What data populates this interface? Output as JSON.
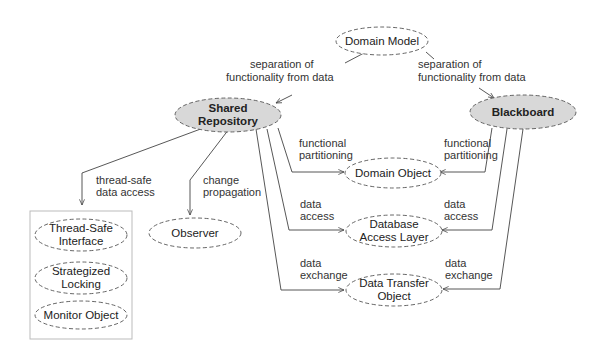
{
  "diagram": {
    "nodes": {
      "domain_model": {
        "label": [
          "Domain Model"
        ],
        "style": "dashed"
      },
      "shared_repository": {
        "label": [
          "Shared",
          "Repository"
        ],
        "style": "filled-bold"
      },
      "blackboard": {
        "label": [
          "Blackboard"
        ],
        "style": "filled-bold"
      },
      "domain_object": {
        "label": [
          "Domain Object"
        ],
        "style": "dashed"
      },
      "database_access_layer": {
        "label": [
          "Database",
          "Access Layer"
        ],
        "style": "dashed"
      },
      "data_transfer_object": {
        "label": [
          "Data Transfer",
          "Object"
        ],
        "style": "dashed"
      },
      "observer": {
        "label": [
          "Observer"
        ],
        "style": "dashed"
      },
      "thread_safe_interface": {
        "label": [
          "Thread-Safe",
          "Interface"
        ],
        "style": "dashed"
      },
      "strategized_locking": {
        "label": [
          "Strategized",
          "Locking"
        ],
        "style": "dashed"
      },
      "monitor_object": {
        "label": [
          "Monitor Object"
        ],
        "style": "dashed"
      }
    },
    "edges": [
      {
        "from": "domain_model",
        "to": "shared_repository",
        "label": [
          "separation of",
          "functionality from data"
        ]
      },
      {
        "from": "domain_model",
        "to": "blackboard",
        "label": [
          "separation of",
          "functionality from data"
        ]
      },
      {
        "from": "shared_repository",
        "to": "thread_safe_group",
        "label": [
          "thread-safe",
          "data access"
        ]
      },
      {
        "from": "shared_repository",
        "to": "observer",
        "label": [
          "change",
          "propagation"
        ]
      },
      {
        "from": "shared_repository",
        "to": "domain_object",
        "label": [
          "functional",
          "partitioning"
        ]
      },
      {
        "from": "shared_repository",
        "to": "database_access_layer",
        "label": [
          "data",
          "access"
        ]
      },
      {
        "from": "shared_repository",
        "to": "data_transfer_object",
        "label": [
          "data",
          "exchange"
        ]
      },
      {
        "from": "blackboard",
        "to": "domain_object",
        "label": [
          "functional",
          "partitioning"
        ]
      },
      {
        "from": "blackboard",
        "to": "database_access_layer",
        "label": [
          "data",
          "access"
        ]
      },
      {
        "from": "blackboard",
        "to": "data_transfer_object",
        "label": [
          "data",
          "exchange"
        ]
      }
    ],
    "groups": [
      {
        "name": "thread_safe_group",
        "members": [
          "thread_safe_interface",
          "strategized_locking",
          "monitor_object"
        ]
      }
    ]
  }
}
